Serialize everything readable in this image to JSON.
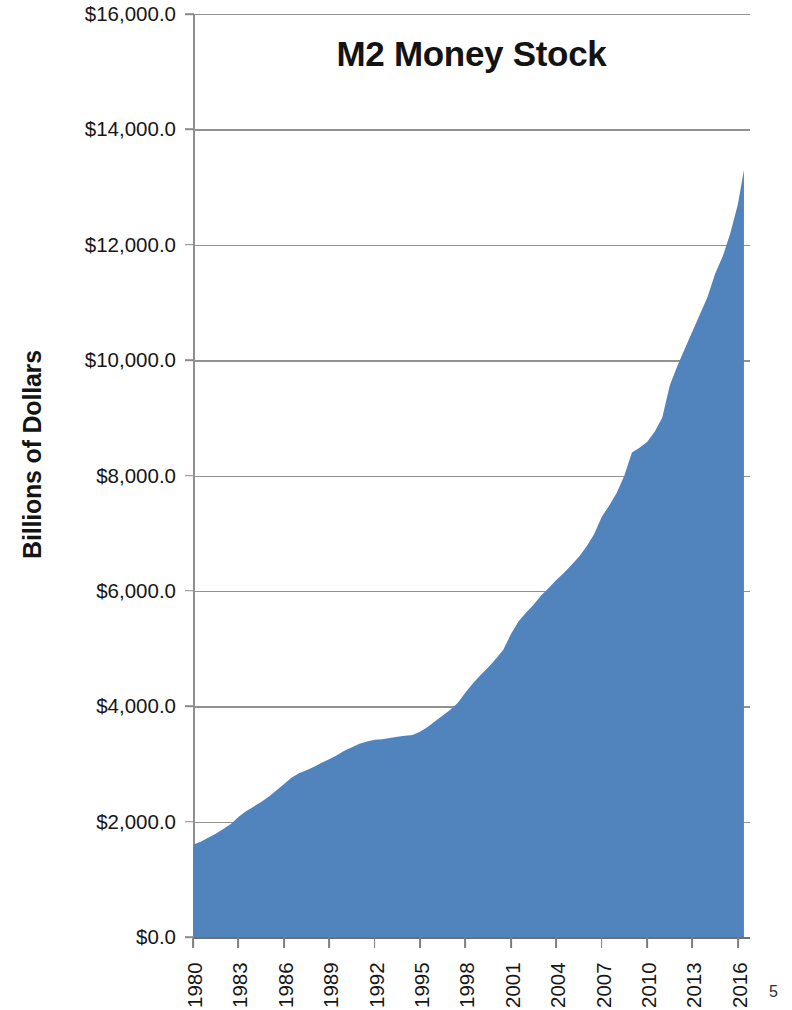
{
  "page": {
    "page_number": "5"
  },
  "chart_data": {
    "type": "area",
    "title": "M2 Money Stock",
    "xlabel": "",
    "ylabel": "Billions of Dollars",
    "xlim": [
      1980,
      2016.8
    ],
    "ylim": [
      0,
      16000
    ],
    "grid": true,
    "legend": false,
    "legend_position": "none",
    "series_color": "#5183bd",
    "y_ticks": [
      0,
      2000,
      4000,
      6000,
      8000,
      10000,
      12000,
      14000,
      16000
    ],
    "y_tick_labels": [
      "$0.0",
      "$2,000.0",
      "$4,000.0",
      "$6,000.0",
      "$8,000.0",
      "$10,000.0",
      "$12,000.0",
      "$14,000.0",
      "$16,000.0"
    ],
    "x_ticks": [
      1980,
      1983,
      1986,
      1989,
      1992,
      1995,
      1998,
      2001,
      2004,
      2007,
      2010,
      2013,
      2016
    ],
    "x_tick_labels": [
      "1980",
      "1983",
      "1986",
      "1989",
      "1992",
      "1995",
      "1998",
      "2001",
      "2004",
      "2007",
      "2010",
      "2013",
      "2016"
    ],
    "x": [
      1980,
      1980.5,
      1981,
      1981.5,
      1982,
      1982.5,
      1983,
      1983.5,
      1984,
      1984.5,
      1985,
      1985.5,
      1986,
      1986.5,
      1987,
      1987.5,
      1988,
      1988.5,
      1989,
      1989.5,
      1990,
      1990.5,
      1991,
      1991.5,
      1992,
      1992.5,
      1993,
      1993.5,
      1994,
      1994.5,
      1995,
      1995.5,
      1996,
      1996.5,
      1997,
      1997.5,
      1998,
      1998.5,
      1999,
      1999.5,
      2000,
      2000.5,
      2001,
      2001.5,
      2002,
      2002.5,
      2003,
      2003.5,
      2004,
      2004.5,
      2005,
      2005.5,
      2006,
      2006.5,
      2007,
      2007.5,
      2008,
      2008.5,
      2009,
      2009.5,
      2010,
      2010.5,
      2011,
      2011.5,
      2012,
      2012.5,
      2013,
      2013.5,
      2014,
      2014.5,
      2015,
      2015.5,
      2016,
      2016.4
    ],
    "values": [
      1600,
      1650,
      1720,
      1790,
      1870,
      1960,
      2080,
      2180,
      2260,
      2340,
      2430,
      2540,
      2650,
      2760,
      2840,
      2890,
      2950,
      3020,
      3080,
      3150,
      3230,
      3290,
      3350,
      3390,
      3420,
      3430,
      3450,
      3470,
      3490,
      3500,
      3560,
      3640,
      3740,
      3840,
      3940,
      4060,
      4240,
      4400,
      4540,
      4670,
      4820,
      4980,
      5250,
      5470,
      5620,
      5760,
      5920,
      6050,
      6190,
      6310,
      6450,
      6590,
      6770,
      6980,
      7280,
      7480,
      7700,
      8000,
      8400,
      8480,
      8580,
      8760,
      9000,
      9560,
      9900,
      10200,
      10500,
      10800,
      11100,
      11500,
      11800,
      12200,
      12700,
      13300
    ],
    "annotations": []
  }
}
